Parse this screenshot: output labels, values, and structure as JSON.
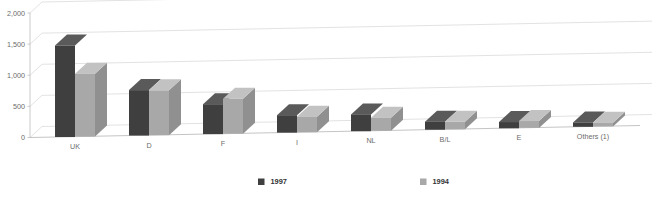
{
  "chart_data": {
    "type": "bar",
    "title": "",
    "subtitle": "",
    "xlabel": "",
    "ylabel": "",
    "categories": [
      "UK",
      "D",
      "F",
      "I",
      "NL",
      "B/L",
      "E",
      "Others (1)"
    ],
    "series": [
      {
        "name": "1997",
        "color": "#3f3f3f",
        "values": [
          1470,
          730,
          480,
          280,
          270,
          130,
          100,
          70
        ]
      },
      {
        "name": "1994",
        "color": "#a8a8a8",
        "values": [
          1010,
          720,
          560,
          250,
          210,
          120,
          110,
          60
        ]
      }
    ],
    "ylim": [
      0,
      2000
    ],
    "ytick_values": [
      0,
      500,
      1000,
      1500,
      2000
    ],
    "ytick_labels": [
      "0",
      "500",
      "1,000",
      "1,500",
      "2,000"
    ],
    "grid": true,
    "grid_axis": "y",
    "legend_position": "bottom",
    "style": "3d-bars",
    "annotations": []
  },
  "legend": {
    "entries": [
      {
        "label": "1997",
        "swatch_color": "#3f3f3f"
      },
      {
        "label": "1994",
        "swatch_color": "#a8a8a8"
      }
    ]
  },
  "colors": {
    "background": "#ffffff",
    "gridline": "#d5d5d5",
    "axis": "#bdbdbd",
    "tick_text": "#6b6b6b",
    "legend_text": "#333333",
    "series_1997": "#3f3f3f",
    "series_1997_top": "#5a5a5a",
    "series_1997_side": "#2d2d2d",
    "series_1994": "#a8a8a8",
    "series_1994_top": "#c2c2c2",
    "series_1994_side": "#909090"
  }
}
